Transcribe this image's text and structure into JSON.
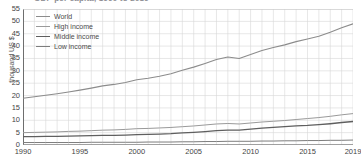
{
  "chart_data": {
    "type": "line",
    "title": "GDP per capita, 1990 to 2019",
    "xlabel": "",
    "ylabel": "thousand US $",
    "xlim": [
      1990,
      2019
    ],
    "ylim": [
      0,
      55
    ],
    "grid": true,
    "legend_position": "top-left",
    "x": [
      1990,
      1991,
      1992,
      1993,
      1994,
      1995,
      1996,
      1997,
      1998,
      1999,
      2000,
      2001,
      2002,
      2003,
      2004,
      2005,
      2006,
      2007,
      2008,
      2009,
      2010,
      2011,
      2012,
      2013,
      2014,
      2015,
      2016,
      2017,
      2018,
      2019
    ],
    "xticks": [
      "1990",
      "1995",
      "2000",
      "2005",
      "2010",
      "2015",
      "2019"
    ],
    "yticks": [
      "0",
      "5",
      "10",
      "15",
      "20",
      "25",
      "30",
      "35",
      "40",
      "45",
      "50",
      "55"
    ],
    "series": [
      {
        "name": "World",
        "color": "#8c8c8c",
        "width": 1.1,
        "values": [
          18.9,
          19.5,
          20.1,
          20.7,
          21.4,
          22.2,
          23.0,
          23.9,
          24.5,
          25.3,
          26.4,
          27.0,
          27.8,
          28.8,
          30.2,
          31.5,
          33.0,
          34.6,
          35.6,
          35.0,
          36.6,
          38.2,
          39.4,
          40.5,
          41.8,
          42.9,
          44.0,
          45.6,
          47.4,
          49.0
        ]
      },
      {
        "name": "High income",
        "color": "#9a9a9a",
        "width": 1.0,
        "values": [
          5.0,
          5.1,
          5.2,
          5.3,
          5.5,
          5.6,
          5.8,
          6.0,
          6.1,
          6.3,
          6.6,
          6.7,
          6.9,
          7.1,
          7.4,
          7.7,
          8.1,
          8.5,
          8.7,
          8.5,
          8.9,
          9.3,
          9.6,
          9.9,
          10.3,
          10.7,
          11.1,
          11.6,
          12.2,
          12.7
        ]
      },
      {
        "name": "Middle income",
        "color": "#5f5f5f",
        "width": 1.3,
        "values": [
          3.4,
          3.4,
          3.5,
          3.5,
          3.6,
          3.7,
          3.8,
          3.9,
          3.9,
          4.0,
          4.2,
          4.3,
          4.4,
          4.6,
          4.9,
          5.1,
          5.4,
          5.8,
          6.0,
          6.0,
          6.4,
          6.8,
          7.1,
          7.4,
          7.7,
          7.9,
          8.2,
          8.6,
          9.1,
          9.5
        ]
      },
      {
        "name": "Low income",
        "color": "#7d7d7d",
        "width": 1.0,
        "values": [
          1.0,
          1.0,
          1.0,
          1.0,
          1.0,
          1.0,
          1.1,
          1.1,
          1.1,
          1.1,
          1.1,
          1.2,
          1.2,
          1.2,
          1.3,
          1.3,
          1.4,
          1.4,
          1.5,
          1.5,
          1.5,
          1.6,
          1.6,
          1.7,
          1.7,
          1.8,
          1.8,
          1.9,
          1.9,
          2.0
        ]
      }
    ]
  }
}
